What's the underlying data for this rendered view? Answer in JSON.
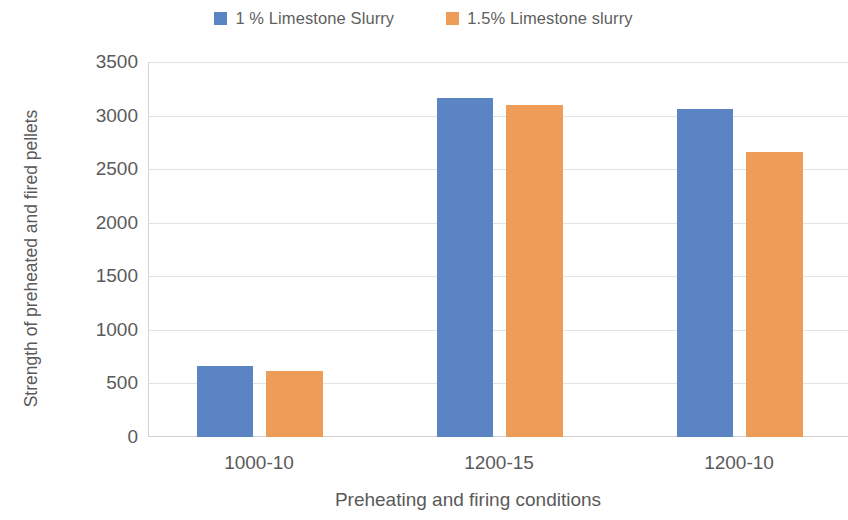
{
  "chart_data": {
    "type": "bar",
    "title": "",
    "categories": [
      "1000-10",
      "1200-15",
      "1200-10"
    ],
    "series": [
      {
        "name": "1 % Limestone Slurry",
        "color": "#5B84C4",
        "values": [
          660,
          3170,
          3070
        ]
      },
      {
        "name": "1.5% Limestone slurry",
        "color": "#ED9D58",
        "values": [
          620,
          3110,
          2670
        ]
      }
    ],
    "xlabel": "Preheating and firing conditions",
    "ylabel": "Strength of preheated and fired pellets",
    "ylim": [
      0,
      3500
    ],
    "ytick_step": 500,
    "yticks": [
      "3500",
      "3000",
      "2500",
      "2000",
      "1500",
      "1000",
      "500",
      "0"
    ],
    "grid": true,
    "legend_position": "top"
  },
  "legend": {
    "items": [
      {
        "label": "1 % Limestone Slurry",
        "color": "#5B84C4"
      },
      {
        "label": "1.5% Limestone slurry",
        "color": "#ED9D58"
      }
    ]
  },
  "axes": {
    "y_title": "Strength of preheated and fired pellets",
    "x_title": "Preheating and firing conditions",
    "y_ticks": [
      "3500",
      "3000",
      "2500",
      "2000",
      "1500",
      "1000",
      "500",
      "0"
    ],
    "x_ticks": [
      "1000-10",
      "1200-15",
      "1200-10"
    ]
  }
}
